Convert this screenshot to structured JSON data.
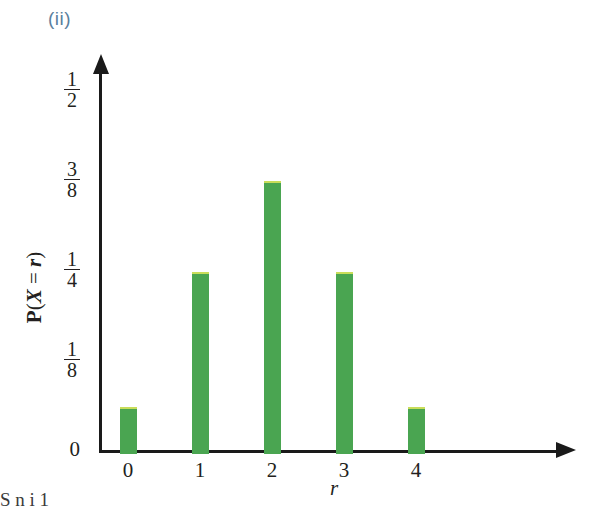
{
  "figure": {
    "part_label": "(ii)",
    "part_label_color": "#5b7f9e",
    "bar_color": "#4aa551",
    "bar_highlight_color": "#c9dd5a",
    "axis_color": "#1a1a1a",
    "caption_fragment": "S   n   i   1"
  },
  "chart_data": {
    "type": "bar",
    "title": "(ii)",
    "categories": [
      "0",
      "1",
      "2",
      "3",
      "4"
    ],
    "values": [
      0.0625,
      0.25,
      0.375,
      0.25,
      0.0625
    ],
    "value_labels": [
      "1/16",
      "1/4",
      "3/8",
      "1/4",
      "1/16"
    ],
    "xlabel": "r",
    "ylabel": "P(X = r)",
    "ylim": [
      0,
      0.5
    ],
    "xlim": [
      -0.5,
      5.2
    ],
    "grid": false,
    "legend": null,
    "ytick_values": [
      0,
      0.125,
      0.25,
      0.375,
      0.5
    ],
    "ytick_labels": [
      "0",
      "1/8",
      "1/4",
      "3/8",
      "1/2"
    ],
    "xtick_labels": [
      "0",
      "1",
      "2",
      "3",
      "4"
    ]
  },
  "yaxis": {
    "label_parts": {
      "p": "P",
      "open": "(",
      "x": "X",
      "eq": " = ",
      "r": "r",
      "close": ")"
    },
    "ticks": [
      {
        "name": "half",
        "num": "1",
        "den": "2",
        "whole": null,
        "top": 91
      },
      {
        "name": "three-eighths",
        "num": "3",
        "den": "8",
        "whole": null,
        "top": 181
      },
      {
        "name": "quarter",
        "num": "1",
        "den": "4",
        "whole": null,
        "top": 271
      },
      {
        "name": "eighth",
        "num": "1",
        "den": "8",
        "whole": null,
        "top": 361
      },
      {
        "name": "zero",
        "num": null,
        "den": null,
        "whole": "0",
        "top": 452
      }
    ]
  },
  "xaxis": {
    "label": "r",
    "ticks": [
      "0",
      "1",
      "2",
      "3",
      "4"
    ]
  },
  "bars": [
    {
      "name": "bar-r-0",
      "category": "0",
      "value_label": "1/16"
    },
    {
      "name": "bar-r-1",
      "category": "1",
      "value_label": "1/4"
    },
    {
      "name": "bar-r-2",
      "category": "2",
      "value_label": "3/8"
    },
    {
      "name": "bar-r-3",
      "category": "3",
      "value_label": "1/4"
    },
    {
      "name": "bar-r-4",
      "category": "4",
      "value_label": "1/16"
    }
  ]
}
